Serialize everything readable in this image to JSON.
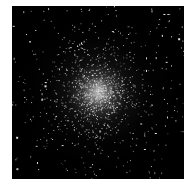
{
  "image": {
    "subject": "globular star cluster",
    "background_color": "#000000",
    "frame_color": "#ffffff",
    "core_color": "#f0f0f0",
    "star_color": "#ffffff"
  }
}
